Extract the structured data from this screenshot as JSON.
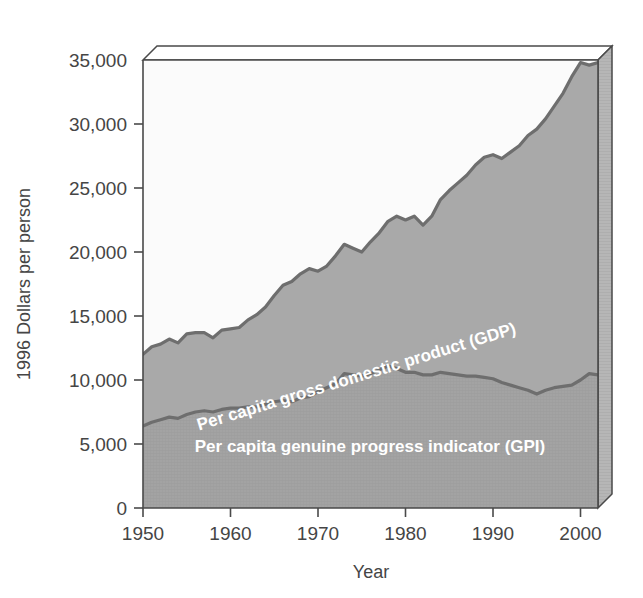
{
  "chart_data": {
    "type": "area",
    "title": "",
    "xlabel": "Year",
    "ylabel": "1996 Dollars per person",
    "xlim": [
      1950,
      2002
    ],
    "ylim": [
      0,
      35000
    ],
    "grid": false,
    "legend_position": "inline-labels",
    "stacked": false,
    "y_ticks": [
      0,
      5000,
      10000,
      15000,
      20000,
      25000,
      30000,
      35000
    ],
    "y_tick_labels": [
      "0",
      "5,000",
      "10,000",
      "15,000",
      "20,000",
      "25,000",
      "30,000",
      "35,000"
    ],
    "x_ticks": [
      1950,
      1960,
      1970,
      1980,
      1990,
      2000
    ],
    "x_tick_labels": [
      "1950",
      "1960",
      "1970",
      "1980",
      "1990",
      "2000"
    ],
    "x": [
      1950,
      1951,
      1952,
      1953,
      1954,
      1955,
      1956,
      1957,
      1958,
      1959,
      1960,
      1961,
      1962,
      1963,
      1964,
      1965,
      1966,
      1967,
      1968,
      1969,
      1970,
      1971,
      1972,
      1973,
      1974,
      1975,
      1976,
      1977,
      1978,
      1979,
      1980,
      1981,
      1982,
      1983,
      1984,
      1985,
      1986,
      1987,
      1988,
      1989,
      1990,
      1991,
      1992,
      1993,
      1994,
      1995,
      1996,
      1997,
      1998,
      1999,
      2000,
      2001,
      2002
    ],
    "series": [
      {
        "name": "Per capita gross domestic product (GDP)",
        "label": "Per capita gross domestic product (GDP)",
        "color": "#a9a9a9",
        "line_color": "#6e6e6e",
        "values": [
          12000,
          12600,
          12800,
          13200,
          12900,
          13600,
          13700,
          13700,
          13300,
          13900,
          14000,
          14100,
          14700,
          15100,
          15700,
          16600,
          17400,
          17700,
          18300,
          18700,
          18500,
          18900,
          19700,
          20600,
          20300,
          20000,
          20800,
          21500,
          22400,
          22800,
          22500,
          22800,
          22100,
          22800,
          24100,
          24800,
          25400,
          26000,
          26800,
          27400,
          27600,
          27300,
          27800,
          28300,
          29100,
          29600,
          30400,
          31400,
          32400,
          33700,
          34800,
          34600,
          34800
        ]
      },
      {
        "name": "Per capita genuine progress indicator (GPI)",
        "label": "Per capita genuine progress indicator (GPI)",
        "color": "#9f9f9f",
        "line_color": "#6e6e6e",
        "values": [
          6400,
          6700,
          6900,
          7100,
          7000,
          7300,
          7500,
          7600,
          7500,
          7700,
          7800,
          7800,
          7900,
          7900,
          8100,
          8300,
          8400,
          8300,
          8600,
          8700,
          9100,
          9400,
          9700,
          10500,
          10400,
          10300,
          10500,
          10800,
          11100,
          10900,
          10600,
          10600,
          10400,
          10400,
          10600,
          10500,
          10400,
          10300,
          10300,
          10200,
          10100,
          9800,
          9600,
          9400,
          9200,
          8900,
          9200,
          9400,
          9500,
          9600,
          10000,
          10500,
          10400
        ]
      }
    ]
  },
  "axis": {
    "y_title": "1996 Dollars per person",
    "x_title": "Year"
  },
  "labels": {
    "gdp_inline": "Per capita gross domestic product (GDP)",
    "gpi_inline": "Per capita genuine progress indicator (GPI)"
  },
  "colors": {
    "gdp_fill": "#a9a9a9",
    "gpi_fill": "#9f9f9f",
    "series_line": "#6e6e6e",
    "frame": "#4a4a4a",
    "side_panel": "#b4b4b4",
    "top_panel": "#ffffff",
    "plot_background": "#fbfbfb",
    "text": "#454545"
  }
}
